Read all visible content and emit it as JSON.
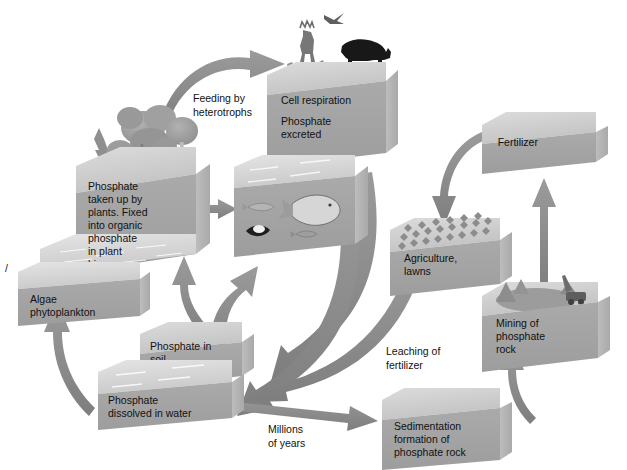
{
  "diagram": {
    "background_color": "#ffffff",
    "palette": {
      "box_front": "#a3a3a3",
      "box_top": "#cfcfcf",
      "box_side": "#b8b8b8",
      "water_top": "#d8d8d8",
      "arrow": "#8c8c8c",
      "arrow_dark": "#7f7f7f",
      "text": "#111111",
      "outline": "#8a8a8a"
    }
  },
  "boxes": {
    "plants": {
      "label": "Phosphate\ntaken up by\nplants. Fixed\ninto organic\nphosphate\nin plant\nbiomass",
      "lines": [
        "Phosphate",
        "taken up by",
        "plants. Fixed",
        "into organic",
        "phosphate",
        "in plant",
        "biomass"
      ],
      "imagery": "forest-trees"
    },
    "algae": {
      "label": "Algae\nphytoplankton",
      "lines": [
        "Algae",
        "phytoplankton"
      ],
      "imagery": "water-surface"
    },
    "animals": {
      "label": "Cell respiration\n\nPhosphate\nexcreted",
      "lines": [
        "Cell respiration",
        "Phosphate",
        "excreted"
      ],
      "imagery": "deer-bear-bird"
    },
    "aquatic": {
      "label": "",
      "lines": [],
      "imagery": "fish-clam-water"
    },
    "soil": {
      "label": "Phosphate in\nsoil",
      "lines": [
        "Phosphate in",
        "soil"
      ],
      "imagery": "soil-surface"
    },
    "water": {
      "label": "Phosphate\ndissolved in water",
      "lines": [
        "Phosphate",
        "dissolved in water"
      ],
      "imagery": "water-surface"
    },
    "agriculture": {
      "label": "Agriculture,\nlawns",
      "lines": [
        "Agriculture,",
        "lawns"
      ],
      "imagery": "crop-rows"
    },
    "fertilizer": {
      "label": "Fertilizer",
      "lines": [
        "Fertilizer"
      ],
      "imagery": "plain-slab"
    },
    "mining": {
      "label": "Mining of\nphosphate\nrock",
      "lines": [
        "Mining of",
        "phosphate",
        "rock"
      ],
      "imagery": "excavator-pit"
    },
    "sedimentation": {
      "label": "Sedimentation\nformation of\nphosphate rock",
      "lines": [
        "Sedimentation",
        "formation of",
        "phosphate rock"
      ],
      "imagery": "plain-block"
    }
  },
  "flow_labels": {
    "feeding": {
      "lines": [
        "Feeding by",
        "heterotrophs"
      ]
    },
    "leaching": {
      "lines": [
        "Leaching of",
        "fertilizer"
      ]
    },
    "millions": {
      "lines": [
        "Millions",
        "of years"
      ]
    }
  },
  "flows": [
    {
      "name": "plants-to-animals",
      "from": "plants",
      "to": "animals",
      "label": "Feeding by heterotrophs",
      "style": "curved"
    },
    {
      "name": "plants-to-aquatic",
      "from": "plants",
      "to": "aquatic",
      "label": "",
      "style": "straight"
    },
    {
      "name": "animals-to-soil",
      "from": "animals",
      "to": "soil",
      "label": "",
      "style": "curved"
    },
    {
      "name": "animals-to-water",
      "from": "animals",
      "to": "water",
      "label": "",
      "style": "curved"
    },
    {
      "name": "soil-to-plants",
      "from": "soil",
      "to": "plants",
      "label": "",
      "style": "curved"
    },
    {
      "name": "water-to-aquatic",
      "from": "water",
      "to": "aquatic",
      "label": "",
      "style": "curved"
    },
    {
      "name": "water-to-algae",
      "from": "water",
      "to": "algae",
      "label": "",
      "style": "curved"
    },
    {
      "name": "water-to-sedimentation",
      "from": "water",
      "to": "sedimentation",
      "label": "Millions of years",
      "style": "straight"
    },
    {
      "name": "sedimentation-to-mining",
      "from": "sedimentation",
      "to": "mining",
      "label": "",
      "style": "curved"
    },
    {
      "name": "mining-to-fertilizer",
      "from": "mining",
      "to": "fertilizer",
      "label": "",
      "style": "straight"
    },
    {
      "name": "fertilizer-to-agriculture",
      "from": "fertilizer",
      "to": "agriculture",
      "label": "",
      "style": "curved"
    },
    {
      "name": "agriculture-to-water",
      "from": "agriculture",
      "to": "water",
      "label": "Leaching of fertilizer",
      "style": "curved"
    }
  ],
  "artifacts": {
    "scan_mark": "/"
  }
}
